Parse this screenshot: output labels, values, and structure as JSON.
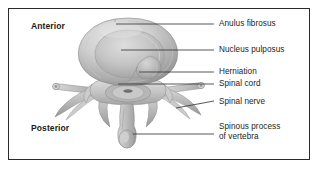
{
  "figure": {
    "border_color": "#2b2b2b",
    "background": "#ffffff",
    "text_color": "#1c1c1c",
    "leader_color": "#3a3a3a"
  },
  "orientation": {
    "anterior": "Anterior",
    "posterior": "Posterior"
  },
  "labels": {
    "anulus_fibrosus": "Anulus fibrosus",
    "nucleus_pulposus": "Nucleus pulposus",
    "herniation": "Herniation",
    "spinal_cord": "Spinal cord",
    "spinal_nerve": "Spinal nerve",
    "spinous_process_line1": "Spinous process",
    "spinous_process_line2": "of vertebra"
  },
  "illustration": {
    "style": "grayscale shaded medical illustration",
    "tones": {
      "highlight": "#e4e4e4",
      "light": "#d2d2d2",
      "mid": "#b8b8b8",
      "shade": "#9a9a9a",
      "dark": "#7e7e7e",
      "outline": "#6d6d6d"
    },
    "parts": [
      "anulus fibrosus (outer disc ring)",
      "nucleus pulposus (inner disc core)",
      "herniation (posterolateral bulge)",
      "spinal cord within vertebral canal",
      "spinal nerve roots at transverse processes",
      "transverse processes",
      "superior articular processes",
      "laminae",
      "spinous process of vertebra"
    ]
  }
}
